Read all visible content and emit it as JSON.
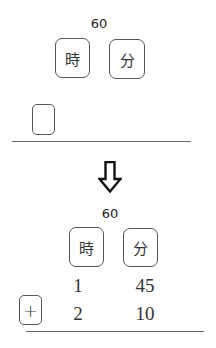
{
  "before": {
    "carry_label": "60",
    "columns": [
      {
        "unit": "時",
        "meaning": "hours"
      },
      {
        "unit": "分",
        "meaning": "minutes"
      }
    ],
    "operator_box": ""
  },
  "arrow": {
    "icon": "down-arrow-icon",
    "glyph": "⇩"
  },
  "after": {
    "carry_label": "60",
    "columns": [
      {
        "unit": "時",
        "meaning": "hours"
      },
      {
        "unit": "分",
        "meaning": "minutes"
      }
    ],
    "rows": [
      {
        "operator": "",
        "hours": "1",
        "minutes": "45"
      },
      {
        "operator": "+",
        "hours": "2",
        "minutes": "10"
      }
    ]
  }
}
